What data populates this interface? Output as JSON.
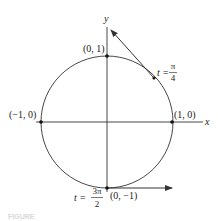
{
  "diagram": {
    "type": "unit-circle-tangent-vectors",
    "colors": {
      "line": "#333333",
      "point": "#111111",
      "text": "#222222",
      "background": "#ffffff"
    },
    "axes": {
      "x_label": "x",
      "y_label": "y"
    },
    "points": {
      "top": "(0, 1)",
      "left": "(−1, 0)",
      "right": "(1, 0)",
      "bottom": "(0, −1)"
    },
    "annotations": {
      "pi_over_4": {
        "prefix": "t =",
        "numerator": "π",
        "denominator": "4"
      },
      "three_pi_over_2": {
        "prefix": "t =",
        "numerator": "3π",
        "denominator": "2"
      }
    },
    "caption": "FIGURE"
  }
}
